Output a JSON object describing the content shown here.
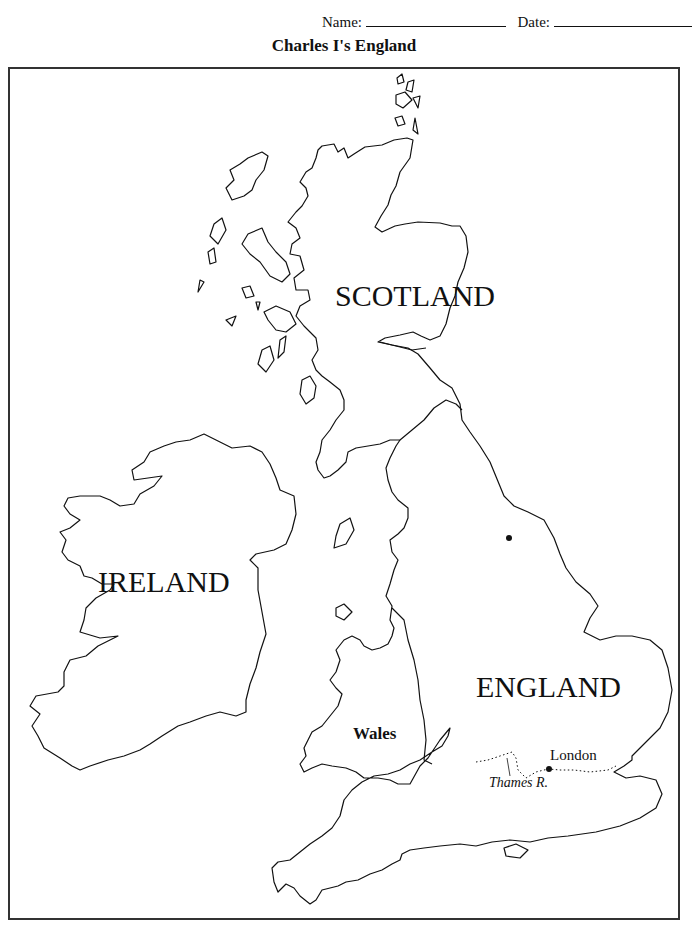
{
  "header": {
    "name_label": "Name:",
    "date_label": "Date:"
  },
  "title": "Charles I's England",
  "map": {
    "labels": {
      "scotland": "SCOTLAND",
      "ireland": "IRELAND",
      "england": "ENGLAND",
      "wales": "Wales",
      "london": "London",
      "thames": "Thames R."
    },
    "markers": [
      {
        "name": "london-marker",
        "x": 549,
        "y": 769
      },
      {
        "name": "york-marker",
        "x": 509,
        "y": 538
      }
    ],
    "line_color": "#111111",
    "frame_color": "#333333"
  }
}
